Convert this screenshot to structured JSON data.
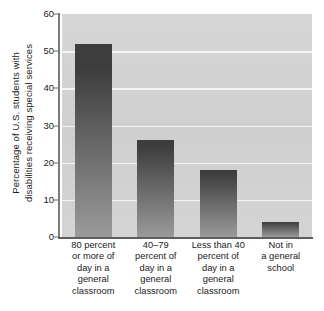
{
  "chart_data": {
    "type": "bar",
    "title": "",
    "subtitle": "",
    "xlabel": "",
    "ylabel": "Percentage of U.S. students with disabilities receiving special services",
    "ylabel_lines": [
      "Percentage of U.S. students with",
      "disabilities receiving special services"
    ],
    "categories": [
      "80 percent or more of day in a general classroom",
      "40–79 percent of day in a general classroom",
      "Less than 40 percent of day in a general classroom",
      "Not in a general school"
    ],
    "category_lines": [
      [
        "80 percent",
        "or more of",
        "day in a",
        "general",
        "classroom"
      ],
      [
        "40–79",
        "percent of",
        "day in a",
        "general",
        "classroom"
      ],
      [
        "Less than 40",
        "percent of",
        "day in a",
        "general",
        "classroom"
      ],
      [
        "Not in",
        "a general",
        "school"
      ]
    ],
    "values": [
      52,
      26,
      18,
      4
    ],
    "ylim": [
      0,
      60
    ],
    "yticks": [
      0,
      10,
      20,
      30,
      40,
      50,
      60
    ],
    "ytick_labels": [
      "0",
      "10",
      "20",
      "30",
      "40",
      "50",
      "60"
    ],
    "gridlines": [
      10,
      20,
      30,
      40,
      50
    ],
    "grid": true,
    "legend": "none",
    "colors": {
      "plot_background": "#d2d2d2",
      "gridline": "#f5f5f5",
      "axis": "#5e5e5e",
      "bar_top": "#3d3d3d",
      "bar_bottom": "#9a9a9a",
      "text": "#1a1a1a",
      "figure_background": "#ffffff"
    }
  }
}
